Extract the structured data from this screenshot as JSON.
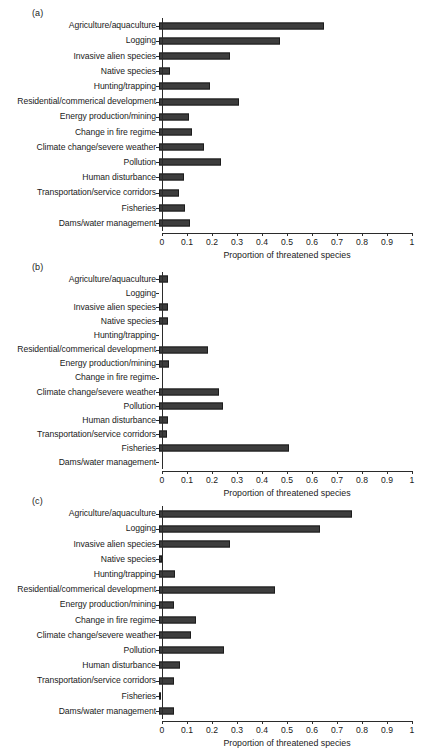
{
  "figure": {
    "bar_color": "#3d3d3d",
    "axis_color": "#2b2b2b",
    "background": "#ffffff"
  },
  "categories": [
    "Agriculture/aquaculture",
    "Logging",
    "Invasive alien species",
    "Native species",
    "Hunting/trapping",
    "Residential/commerical development",
    "Energy production/mining",
    "Change in fire regime",
    "Climate change/severe weather",
    "Pollution",
    "Human disturbance",
    "Transportation/service corridors",
    "Fisheries",
    "Dams/water management"
  ],
  "axis": {
    "xlabel": "Proportion of threatened species",
    "ticks": [
      0,
      0.1,
      0.2,
      0.3,
      0.4,
      0.5,
      0.6,
      0.7,
      0.8,
      0.9,
      1
    ],
    "ticklabels": [
      "0",
      "0.1",
      "0.2",
      "0.3",
      "0.4",
      "0.5",
      "0.6",
      "0.7",
      "0.8",
      "0.9",
      "1"
    ],
    "xlim": [
      0,
      1
    ],
    "grid": false
  },
  "panels": [
    {
      "tag": "(a)"
    },
    {
      "tag": "(b)"
    },
    {
      "tag": "(c)"
    }
  ],
  "chart_data": [
    {
      "type": "bar",
      "title": "(a)",
      "orientation": "horizontal",
      "xlabel": "Proportion of threatened species",
      "ylabel": "",
      "xlim": [
        0,
        1
      ],
      "grid": false,
      "legend": null,
      "categories": [
        "Agriculture/aquaculture",
        "Logging",
        "Invasive alien species",
        "Native species",
        "Hunting/trapping",
        "Residential/commerical development",
        "Energy production/mining",
        "Change in fire regime",
        "Climate change/severe weather",
        "Pollution",
        "Human disturbance",
        "Transportation/service corridors",
        "Fisheries",
        "Dams/water management"
      ],
      "values": [
        0.66,
        0.485,
        0.285,
        0.042,
        0.205,
        0.32,
        0.121,
        0.132,
        0.179,
        0.249,
        0.098,
        0.079,
        0.104,
        0.122
      ]
    },
    {
      "type": "bar",
      "title": "(b)",
      "orientation": "horizontal",
      "xlabel": "Proportion of threatened species",
      "ylabel": "",
      "xlim": [
        0,
        1
      ],
      "grid": false,
      "legend": null,
      "categories": [
        "Agriculture/aquaculture",
        "Logging",
        "Invasive alien species",
        "Native species",
        "Hunting/trapping",
        "Residential/commerical development",
        "Energy production/mining",
        "Change in fire regime",
        "Climate change/severe weather",
        "Pollution",
        "Human disturbance",
        "Transportation/service corridors",
        "Fisheries",
        "Dams/water management"
      ],
      "values": [
        0.037,
        0.0,
        0.036,
        0.036,
        0.0,
        0.195,
        0.038,
        0.0,
        0.238,
        0.254,
        0.036,
        0.031,
        0.52,
        0.0
      ]
    },
    {
      "type": "bar",
      "title": "(c)",
      "orientation": "horizontal",
      "xlabel": "Proportion of threatened species",
      "ylabel": "",
      "xlim": [
        0,
        1
      ],
      "grid": false,
      "legend": null,
      "categories": [
        "Agriculture/aquaculture",
        "Logging",
        "Invasive alien species",
        "Native species",
        "Hunting/trapping",
        "Residential/commerical development",
        "Energy production/mining",
        "Change in fire regime",
        "Climate change/severe weather",
        "Pollution",
        "Human disturbance",
        "Transportation/service corridors",
        "Fisheries",
        "Dams/water management"
      ],
      "values": [
        0.77,
        0.645,
        0.285,
        0.011,
        0.062,
        0.465,
        0.058,
        0.147,
        0.126,
        0.258,
        0.084,
        0.059,
        0.007,
        0.058
      ]
    }
  ]
}
